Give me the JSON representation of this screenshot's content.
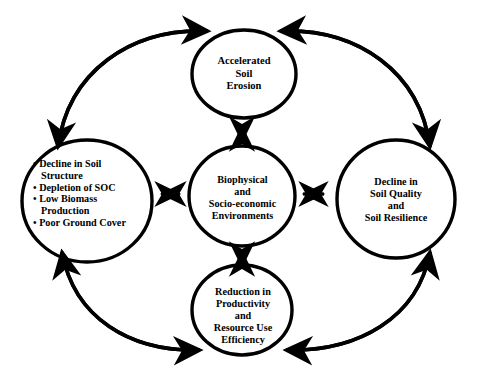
{
  "diagram": {
    "style": {
      "stroke_color": "#000000",
      "text_color": "#000000",
      "background": "#ffffff"
    },
    "nodes": {
      "top": {
        "name": "Accelerated Soil Erosion",
        "lines": [
          "Accelerated",
          "Soil",
          "Erosion"
        ]
      },
      "left": {
        "name": "Soil physical degradation indicators",
        "bullets": [
          [
            "Decline in Soil",
            "Structure"
          ],
          [
            "Depletion of SOC"
          ],
          [
            "Low Biomass",
            "Production"
          ],
          [
            "Poor Ground Cover"
          ]
        ],
        "bullet_glyph": "•"
      },
      "center": {
        "name": "Biophysical and Socio-economic Environments",
        "lines": [
          "Biophysical",
          "and",
          "Socio-economic",
          "Environments"
        ]
      },
      "right": {
        "name": "Decline in Soil Quality and Soil Resilience",
        "lines": [
          "Decline in",
          "Soil Quality",
          "and",
          "Soil Resilience"
        ]
      },
      "bottom": {
        "name": "Reduction in Productivity and Resource Use Efficiency",
        "lines": [
          "Reduction in",
          "Productivity",
          "and",
          "Resource Use",
          "Efficiency"
        ]
      }
    },
    "connectors": {
      "spokes": [
        {
          "id": "left-center",
          "from": "left",
          "to": "center",
          "direction": "bidirectional",
          "orientation": "horizontal"
        },
        {
          "id": "center-right",
          "from": "center",
          "to": "right",
          "direction": "bidirectional",
          "orientation": "horizontal"
        },
        {
          "id": "top-center",
          "from": "top",
          "to": "center",
          "direction": "bidirectional",
          "orientation": "vertical"
        },
        {
          "id": "center-bottom",
          "from": "center",
          "to": "bottom",
          "direction": "bidirectional",
          "orientation": "vertical"
        }
      ],
      "outer_arcs": [
        {
          "id": "left-top",
          "from": "left",
          "to": "top",
          "direction": "bidirectional"
        },
        {
          "id": "top-right",
          "from": "top",
          "to": "right",
          "direction": "bidirectional"
        },
        {
          "id": "bottom-left",
          "from": "bottom",
          "to": "left",
          "direction": "bidirectional"
        },
        {
          "id": "right-bottom",
          "from": "right",
          "to": "bottom",
          "direction": "bidirectional"
        }
      ]
    }
  }
}
